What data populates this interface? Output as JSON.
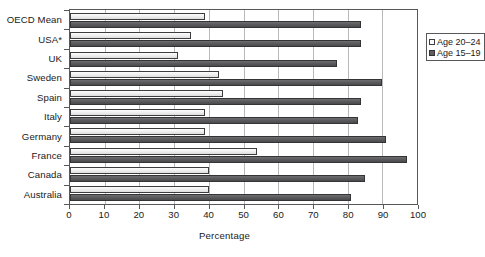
{
  "chart_data": {
    "type": "bar",
    "orientation": "horizontal",
    "title": "",
    "xlabel": "Percentage",
    "ylabel": "",
    "xlim": [
      0,
      100
    ],
    "xticks": [
      0,
      10,
      20,
      30,
      40,
      50,
      60,
      70,
      80,
      90,
      100
    ],
    "grid": "vertical",
    "legend_position": "top-right-inside",
    "categories": [
      "OECD Mean",
      "USA*",
      "UK",
      "Sweden",
      "Spain",
      "Italy",
      "Germany",
      "France",
      "Canada",
      "Australia"
    ],
    "series": [
      {
        "name": "Age 20–24",
        "color": "#ececec",
        "values": [
          39,
          35,
          31,
          43,
          44,
          39,
          39,
          54,
          40,
          40
        ]
      },
      {
        "name": "Age 15–19",
        "color": "#5e5e60",
        "values": [
          84,
          84,
          77,
          90,
          84,
          83,
          91,
          97,
          85,
          81
        ]
      }
    ]
  },
  "axis": {
    "x_title": "Percentage",
    "tick_labels": [
      "0",
      "10",
      "20",
      "30",
      "40",
      "50",
      "60",
      "70",
      "80",
      "90",
      "100"
    ]
  },
  "legend": {
    "items": [
      {
        "label": "Age 20–24",
        "swatch": "light-square-swatch"
      },
      {
        "label": "Age 15–19",
        "swatch": "dark-square-swatch"
      }
    ]
  },
  "footer": {
    "sliver_text": ""
  }
}
